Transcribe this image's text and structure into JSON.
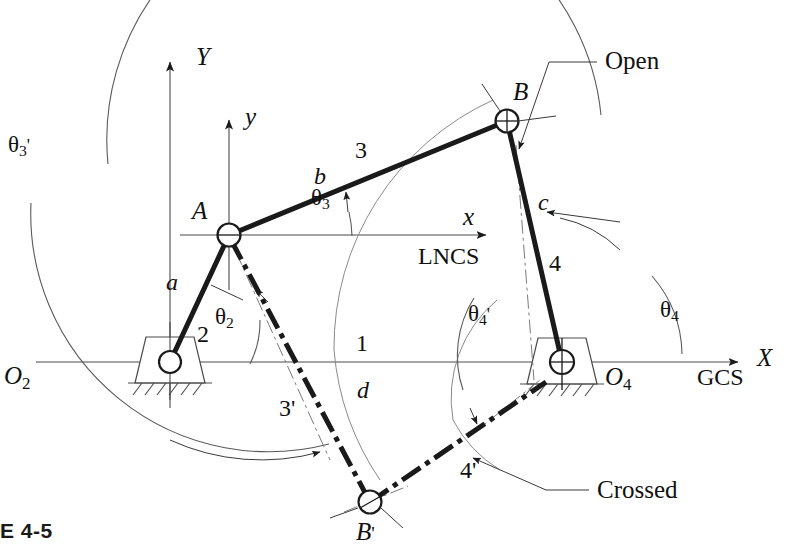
{
  "figure": {
    "caption": "E 4-5"
  },
  "axes": {
    "global": {
      "x_label": "X",
      "y_label": "Y",
      "system_label": "GCS"
    },
    "local": {
      "x_label": "x",
      "y_label": "y",
      "system_label": "LNCS"
    }
  },
  "joints": [
    {
      "id": "O2",
      "base": "O",
      "subscript": "2",
      "prime": ""
    },
    {
      "id": "A",
      "base": "A",
      "subscript": "",
      "prime": ""
    },
    {
      "id": "B",
      "base": "B",
      "subscript": "",
      "prime": ""
    },
    {
      "id": "O4",
      "base": "O",
      "subscript": "4",
      "prime": ""
    },
    {
      "id": "Bp",
      "base": "B",
      "subscript": "",
      "prime": "'"
    }
  ],
  "links": {
    "numbers": {
      "ground": "1",
      "crank": "2",
      "coupler": "3",
      "rocker": "4",
      "coupler_crossed": "3'",
      "rocker_crossed": "4'"
    },
    "lengths": {
      "ground": "d",
      "crank": "a",
      "coupler": "b",
      "rocker": "c"
    }
  },
  "angles": {
    "theta2": {
      "base": "θ",
      "subscript": "2",
      "prime": ""
    },
    "theta3": {
      "base": "θ",
      "subscript": "3",
      "prime": ""
    },
    "theta4": {
      "base": "θ",
      "subscript": "4",
      "prime": ""
    },
    "theta3p": {
      "base": "θ",
      "subscript": "3",
      "prime": "'"
    },
    "theta4p": {
      "base": "θ",
      "subscript": "4",
      "prime": "'"
    }
  },
  "annotations": {
    "open": "Open",
    "crossed": "Crossed"
  },
  "colors": {
    "link_stroke": "#1a1a1a",
    "axis_stroke": "#4a4a4a",
    "arc_stroke": "#5a5a5a",
    "background": "#ffffff"
  }
}
